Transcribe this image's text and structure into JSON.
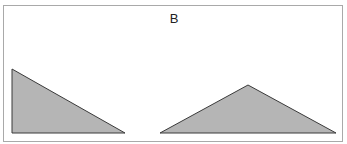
{
  "figure": {
    "label": "B",
    "frame_color": "#a9a9a9",
    "fill_color": "#b5b5b5",
    "stroke_color": "#3a3a3a",
    "shapes": [
      {
        "name": "right-triangle",
        "points": "12,69 12,133 125,133"
      },
      {
        "name": "obtuse-triangle",
        "points": "160,133 248,85 336,133"
      }
    ]
  }
}
